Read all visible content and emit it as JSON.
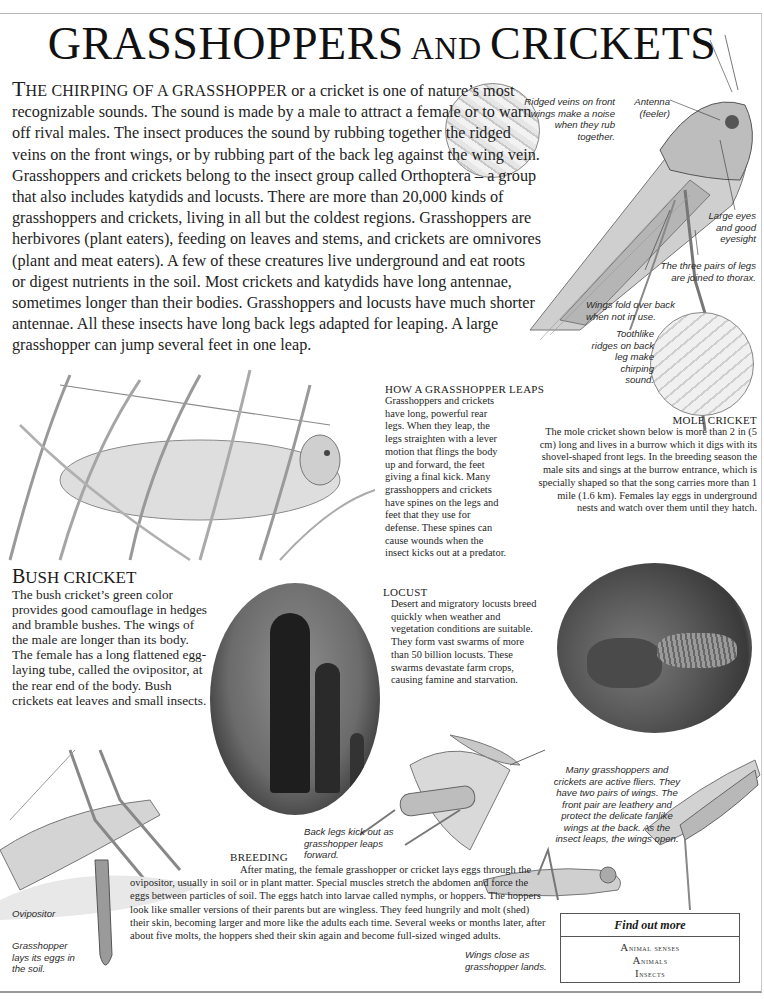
{
  "page": {
    "title_main_1": "G",
    "title_main_2": "RASSHOPPERS",
    "title_small": " AND ",
    "title_main_3": "CRICKETS"
  },
  "intro": {
    "lead_cap": "T",
    "lead": "HE CHIRPING OF A GRASSHOPPER",
    "body": " or a cricket is one of nature’s most recognizable sounds. The sound is made by a male to attract a female or to warn off rival males. The insect produces the sound by rubbing together the ridged veins on the front wings, or by rubbing part of the back leg against the wing vein. Grasshoppers and crickets belong to the insect group called Orthoptera – a group that also includes katydids and locusts. There are more than 20,000 kinds of grasshoppers and crickets, living in all but the coldest regions. Grasshoppers are herbivores (plant eaters), feeding on leaves and stems, and crickets are omnivores (plant and meat eaters). A few of these creatures live underground and eat roots or digest nutrients in the soil. Most crickets and katydids have long antennae, sometimes longer than their bodies. Grasshoppers and locusts have much shorter antennae. All these insects have long back legs adapted for leaping. A large grasshopper can jump several feet in one leap."
  },
  "labels": {
    "ridged_veins": "Ridged veins on front wings make a noise when they rub together.",
    "antenna": "Antenna (feeler)",
    "large_eyes": "Large eyes and good eyesight",
    "three_pairs": "The three pairs of legs are joined to thorax.",
    "wings_fold": "Wings fold over back when not in use.",
    "toothlike": "Toothlike ridges on back leg make chirping sound.",
    "back_legs_kick": "Back legs kick out as grasshopper leaps forward.",
    "active_fliers": "Many grasshoppers and crickets are active fliers. They have two pairs of wings. The front pair are leathery and protect the delicate fanlike wings at the back. As the insect leaps, the wings open.",
    "wings_close": "Wings close as grasshopper lands.",
    "ovipositor": "Ovipositor",
    "lays_eggs": "Grasshopper lays its eggs in the soil."
  },
  "how_leaps": {
    "heading": "HOW A GRASSHOPPER LEAPS",
    "body": "Grasshoppers and crickets have long, powerful rear legs. When they leap, the legs straighten with a lever motion that flings the body up and forward, the feet giving a final kick. Many grasshoppers and crickets have spines on the legs and feet that they use for defense. These spines can cause wounds when the insect kicks out at a predator."
  },
  "mole_cricket": {
    "heading": "MOLE CRICKET",
    "body": "The mole cricket shown below is more than 2 in (5 cm) long and lives in a burrow which it digs with its shovel-shaped front legs. In the breeding season the male sits and sings at the burrow entrance, which is specially shaped so that the song carries more than 1 mile (1.6 km). Females lay eggs in underground nests and watch over them until they hatch."
  },
  "bush_cricket": {
    "heading_cap": "B",
    "heading_rest": "USH CRICKET",
    "body": "The bush cricket’s green color provides good camouflage in hedges and bramble bushes. The wings of the male are longer than its body. The female has a long flattened egg-laying tube, called the ovipositor, at the rear end of the body. Bush crickets eat leaves and small insects."
  },
  "locust": {
    "heading": "LOCUST",
    "body": "Desert and migratory locusts breed quickly when weather and vegetation conditions are suitable. They form vast swarms of more than 50 billion locusts. These swarms devastate farm crops, causing famine and starvation."
  },
  "breeding": {
    "heading": "BREEDING",
    "body": "After mating, the female grasshopper or cricket lays eggs through the ovipositor, usually in soil or in plant matter. Special muscles stretch the abdomen and force the eggs between particles of soil. The eggs hatch into larvae called nymphs, or hoppers. The hoppers look like smaller versions of their parents but are wingless. They feed hungrily and molt (shed) their skin, becoming larger and more like the adults each time. Several weeks or months later, after about five molts, the hoppers shed their skin again and become full-sized winged adults."
  },
  "find_out_more": {
    "title": "Find out more",
    "items": [
      "Animal senses",
      "Animals",
      "Insects"
    ]
  }
}
